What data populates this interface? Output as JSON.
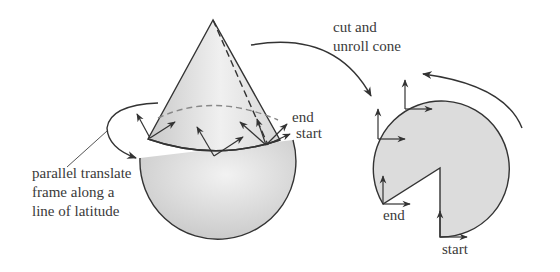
{
  "figure": {
    "left": {
      "description": "cone sitting on a sphere with a frame parallel-translated along a line of latitude",
      "labels": {
        "translate_line1": "parallel translate",
        "translate_line2": "frame along a",
        "translate_line3": "line of latitude",
        "end": "end",
        "start": "start"
      }
    },
    "transition": {
      "label_line1": "cut and",
      "label_line2": "unroll cone"
    },
    "right": {
      "description": "unrolled cone as a circular sector with frames transported around it",
      "labels": {
        "end": "end",
        "start": "start"
      }
    },
    "colors": {
      "stroke": "#333333",
      "fill": "#dcdcdc",
      "text": "#3a3a3a"
    }
  }
}
